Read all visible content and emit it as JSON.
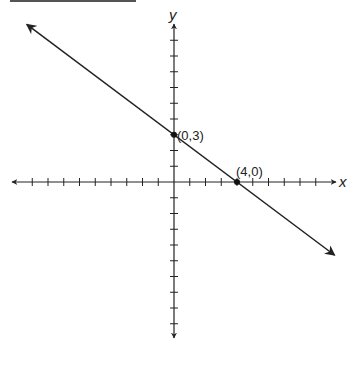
{
  "chart_data": {
    "type": "line",
    "title": "",
    "xlabel": "x",
    "ylabel": "y",
    "xlim": [
      -9,
      9
    ],
    "ylim": [
      -9,
      9
    ],
    "grid": false,
    "series": [
      {
        "name": "line",
        "equation": "y = -3/4 x + 3",
        "slope": -0.75,
        "intercept": 3,
        "arrows_both_ends": true
      }
    ],
    "points": [
      {
        "x": 0,
        "y": 3,
        "label": "(0,3)"
      },
      {
        "x": 4,
        "y": 0,
        "label": "(4,0)"
      }
    ],
    "annotations": [
      "(0,3)",
      "(4,0)"
    ]
  },
  "axes": {
    "x_label": "x",
    "y_label": "y"
  },
  "labels": {
    "p1": "(0,3)",
    "p2": "(4,0)"
  },
  "colors": {
    "ink": "#222222",
    "header_rule": "#555555"
  }
}
